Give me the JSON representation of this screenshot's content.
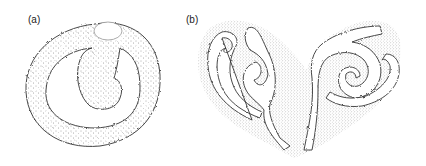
{
  "figure": {
    "panels": [
      {
        "id": "a",
        "label": "(a)",
        "description": "Stippled annular ring with an inward-curling spiral arm and a small oval clear region at the top"
      },
      {
        "id": "b",
        "label": "(b)",
        "description": "Heart-shaped stippled field containing two mirrored white spiral channels"
      }
    ],
    "colors": {
      "outline": "#333333",
      "stipple": "#555555",
      "background": "#ffffff"
    }
  }
}
